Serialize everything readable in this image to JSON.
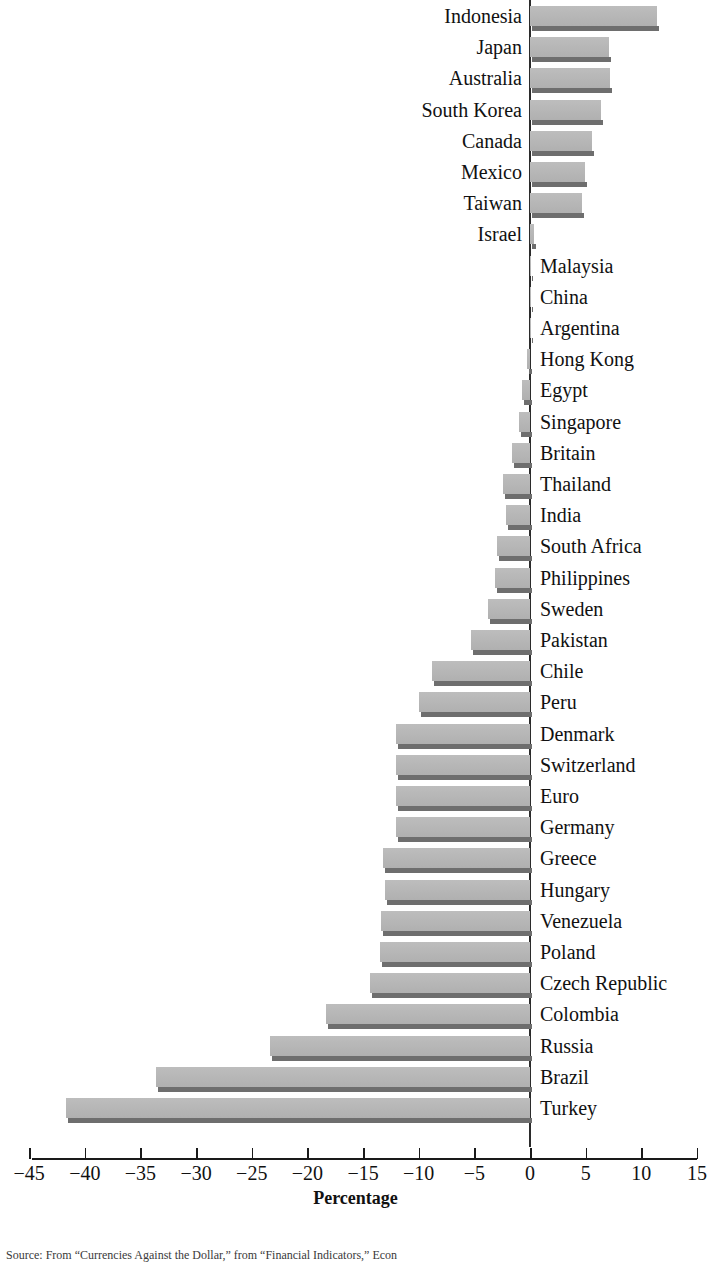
{
  "chart_data": {
    "type": "bar",
    "orientation": "horizontal",
    "title": "",
    "xlabel": "Percentage",
    "ylabel": "",
    "xlim": [
      -45,
      15
    ],
    "xticks": [
      -45,
      -40,
      -35,
      -30,
      -25,
      -20,
      -15,
      -10,
      -5,
      0,
      5,
      10,
      15
    ],
    "xtick_labels": [
      "−45",
      "−40",
      "−35",
      "−30",
      "−25",
      "−20",
      "−15",
      "−10",
      "−5",
      "0",
      "5",
      "10",
      "15"
    ],
    "grid": false,
    "legend": null,
    "categories": [
      "Indonesia",
      "Japan",
      "Australia",
      "South Korea",
      "Canada",
      "Mexico",
      "Taiwan",
      "Israel",
      "Malaysia",
      "China",
      "Argentina",
      "Hong Kong",
      "Egypt",
      "Singapore",
      "Britain",
      "Thailand",
      "India",
      "South Africa",
      "Philippines",
      "Sweden",
      "Pakistan",
      "Chile",
      "Peru",
      "Denmark",
      "Switzerland",
      "Euro",
      "Germany",
      "Greece",
      "Hungary",
      "Venezuela",
      "Poland",
      "Czech Republic",
      "Colombia",
      "Russia",
      "Brazil",
      "Turkey"
    ],
    "values": [
      11.4,
      7.1,
      7.2,
      6.4,
      5.6,
      4.9,
      4.7,
      0.4,
      0.0,
      0.0,
      0.0,
      -0.3,
      -0.7,
      -1.0,
      -1.6,
      -2.4,
      -2.2,
      -3.0,
      -3.1,
      -3.8,
      -5.3,
      -8.8,
      -10.0,
      -12.0,
      -12.0,
      -12.0,
      -12.0,
      -13.2,
      -13.0,
      -13.4,
      -13.5,
      -14.4,
      -18.3,
      -23.4,
      -33.6,
      -41.7
    ]
  },
  "axis": {
    "x_title": "Percentage"
  },
  "source": {
    "note": "Source: From “Currencies Against the Dollar,” from “Financial Indicators,” Econ"
  },
  "colors": {
    "bar_fill": "#b6b6b6",
    "bar_shadow": "#6e6e6e",
    "axis": "#1a1a1a",
    "text": "#111111"
  }
}
